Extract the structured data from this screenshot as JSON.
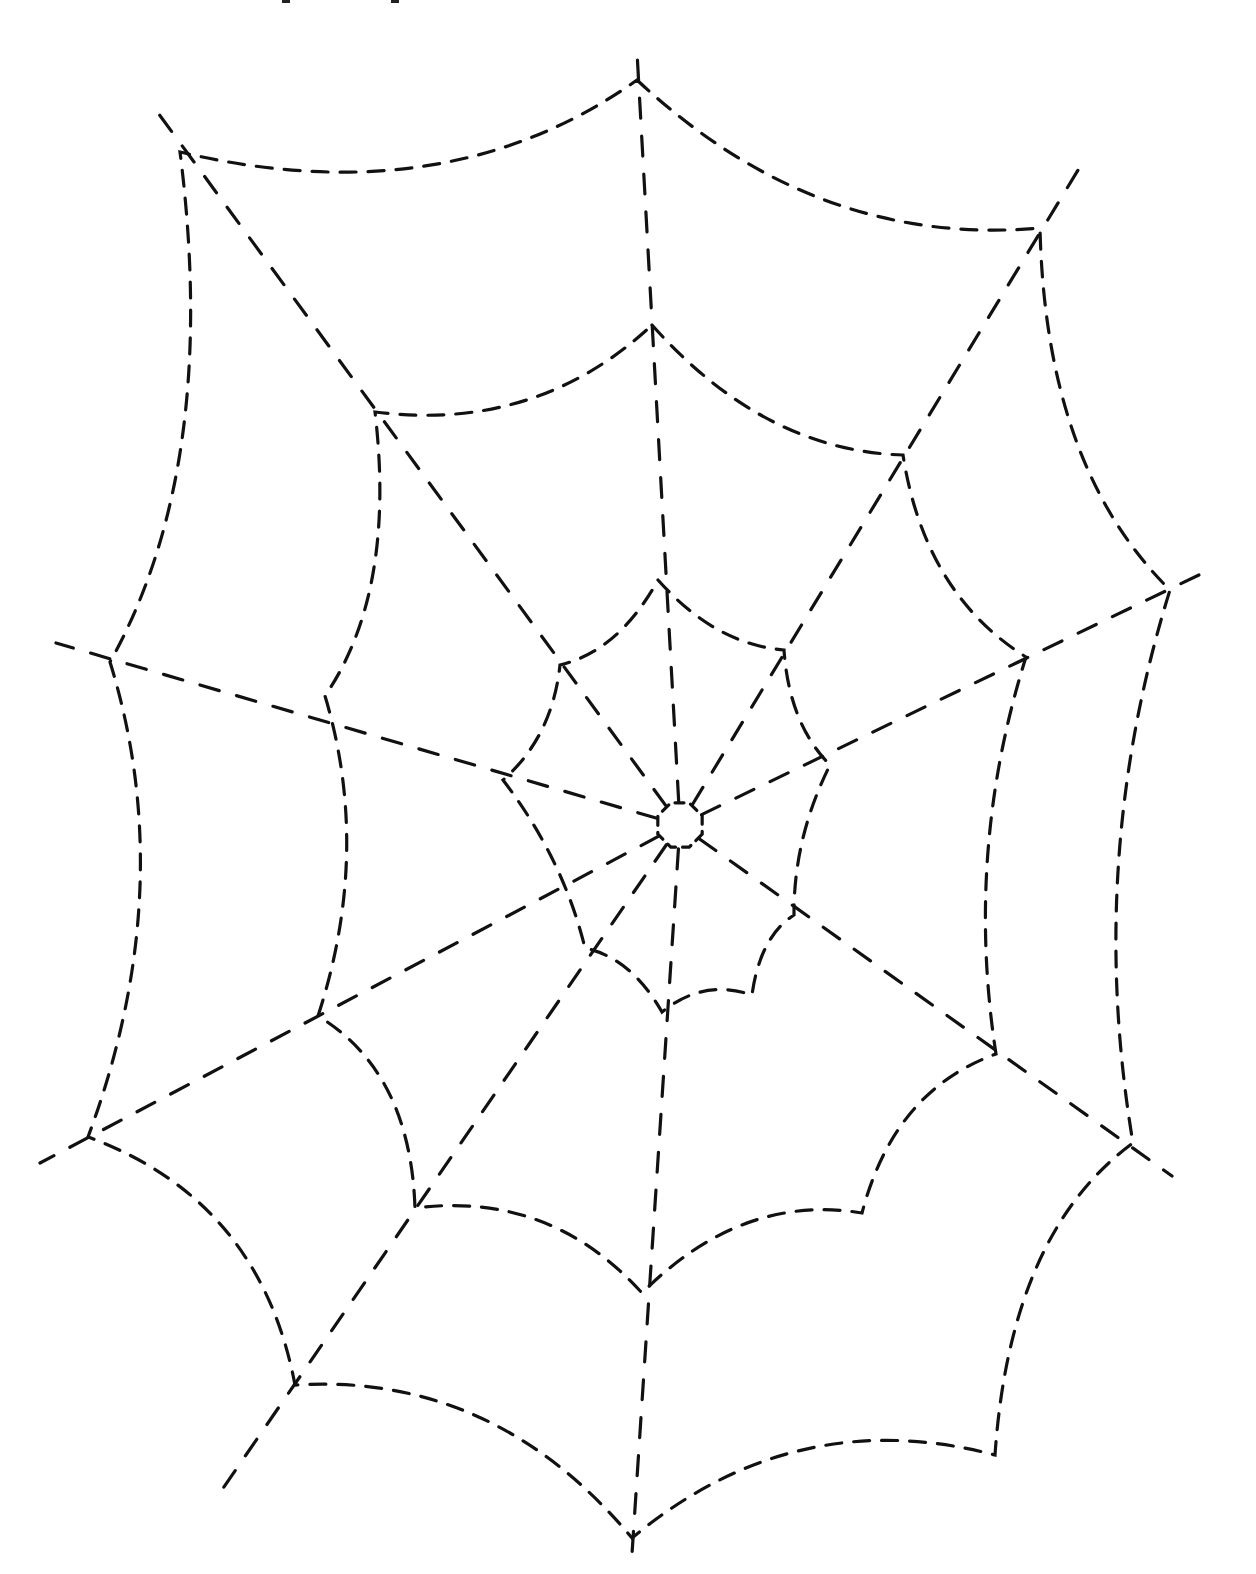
{
  "worksheet": {
    "title": "",
    "subject": "spider web tracing page",
    "line_color": "#111111",
    "background": "#ffffff"
  },
  "web": {
    "hub_center": [
      680,
      825
    ],
    "hub_radius": 24,
    "radial_ends": [
      [
        637,
        52
      ],
      [
        1086,
        157
      ],
      [
        1203,
        573
      ],
      [
        1172,
        1176
      ],
      [
        632,
        1554
      ],
      [
        217,
        1497
      ],
      [
        40,
        1163
      ],
      [
        56,
        643
      ],
      [
        150,
        102
      ]
    ],
    "rings": [
      {
        "name": "inner-ring",
        "nodes": [
          [
            658,
            580
          ],
          [
            784,
            650
          ],
          [
            830,
            765
          ],
          [
            794,
            915
          ],
          [
            752,
            995
          ],
          [
            662,
            1012
          ],
          [
            585,
            948
          ],
          [
            503,
            780
          ],
          [
            560,
            665
          ]
        ]
      },
      {
        "name": "middle-ring",
        "nodes": [
          [
            652,
            325
          ],
          [
            903,
            455
          ],
          [
            1026,
            657
          ],
          [
            996,
            1054
          ],
          [
            862,
            1213
          ],
          [
            642,
            1293
          ],
          [
            415,
            1208
          ],
          [
            318,
            1016
          ],
          [
            325,
            696
          ],
          [
            375,
            412
          ]
        ]
      },
      {
        "name": "outer-ring",
        "nodes": [
          [
            637,
            80
          ],
          [
            1040,
            228
          ],
          [
            1170,
            590
          ],
          [
            1133,
            1143
          ],
          [
            995,
            1455
          ],
          [
            632,
            1538
          ],
          [
            295,
            1385
          ],
          [
            88,
            1137
          ],
          [
            110,
            662
          ],
          [
            180,
            152
          ]
        ]
      }
    ]
  }
}
